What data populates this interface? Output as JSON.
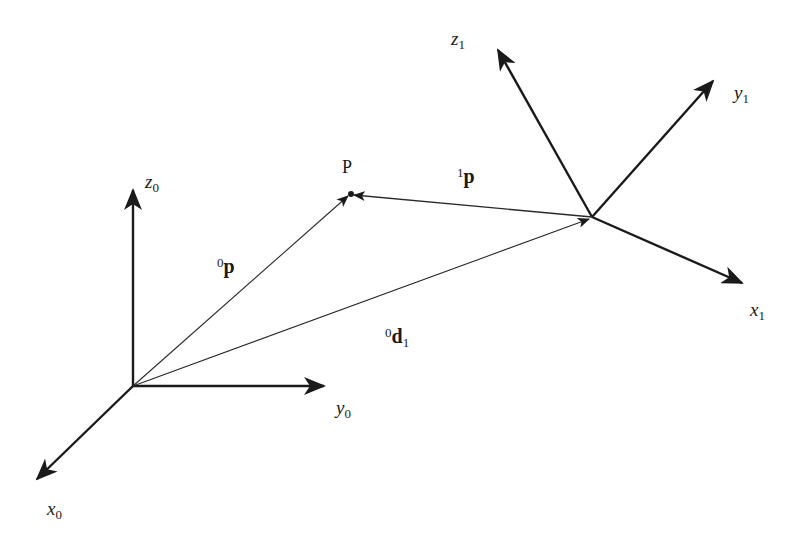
{
  "diagram": {
    "frames": [
      {
        "id": "frame0",
        "axes": [
          {
            "id": "x0",
            "label": "x",
            "subscript": "0"
          },
          {
            "id": "y0",
            "label": "y",
            "subscript": "0"
          },
          {
            "id": "z0",
            "label": "z",
            "subscript": "0"
          }
        ]
      },
      {
        "id": "frame1",
        "axes": [
          {
            "id": "x1",
            "label": "x",
            "subscript": "1"
          },
          {
            "id": "y1",
            "label": "y",
            "subscript": "1"
          },
          {
            "id": "z1",
            "label": "z",
            "subscript": "1"
          }
        ]
      }
    ],
    "point": {
      "label": "P"
    },
    "vectors": [
      {
        "id": "p0",
        "from": "frame0-origin",
        "to": "P",
        "superscript": "0",
        "symbol": "p",
        "subscript": ""
      },
      {
        "id": "p1",
        "from": "frame1-origin",
        "to": "P",
        "superscript": "1",
        "symbol": "p",
        "subscript": ""
      },
      {
        "id": "d01",
        "from": "frame0-origin",
        "to": "frame1-origin",
        "superscript": "0",
        "symbol": "d",
        "subscript": "1"
      }
    ]
  }
}
